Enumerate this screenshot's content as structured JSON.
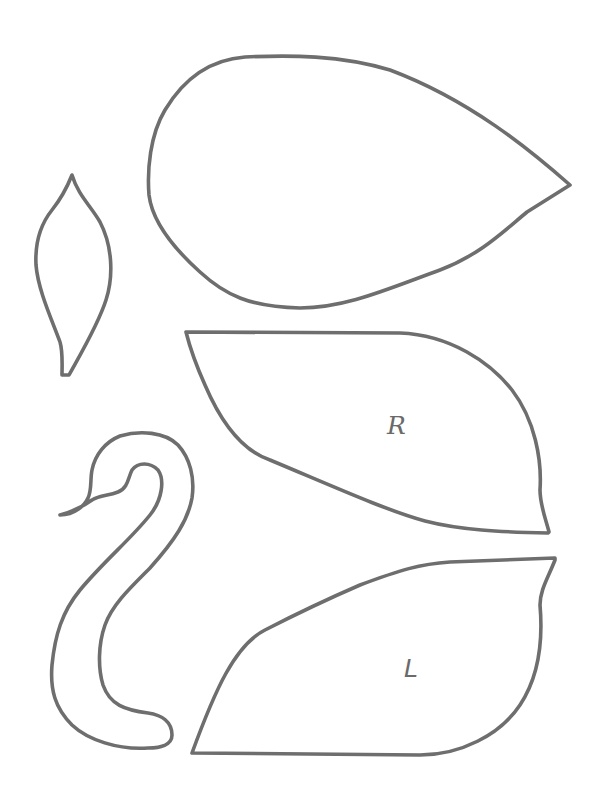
{
  "template": {
    "title": "Swan craft template",
    "background_color": "#ffffff",
    "stroke_color": "#6e6e6e",
    "pieces": [
      {
        "id": "body",
        "label": ""
      },
      {
        "id": "tail-feather",
        "label": ""
      },
      {
        "id": "right-wing",
        "label": "R"
      },
      {
        "id": "neck-head",
        "label": ""
      },
      {
        "id": "left-wing",
        "label": "L"
      }
    ]
  }
}
